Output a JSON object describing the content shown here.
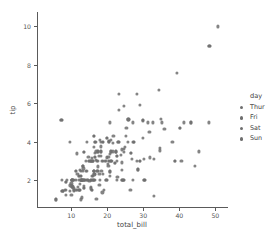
{
  "chart_data": {
    "type": "scatter",
    "title": "",
    "xlabel": "total_bill",
    "ylabel": "tip",
    "xlim": [
      0.5,
      53.5
    ],
    "ylim": [
      0.55,
      10.75
    ],
    "xticks": [
      10,
      20,
      30,
      40,
      50
    ],
    "yticks": [
      2,
      4,
      6,
      8,
      10
    ],
    "grid": false,
    "legend": {
      "title": "day",
      "position": "right",
      "entries": [
        {
          "label": "Thur",
          "color": "#6e6e6e"
        },
        {
          "label": "Fri",
          "color": "#6e6e6e"
        },
        {
          "label": "Sat",
          "color": "#6e6e6e"
        },
        {
          "label": "Sun",
          "color": "#6e6e6e"
        }
      ]
    },
    "marker": {
      "shape": "circle",
      "color": "#6e6e6e",
      "size": 3.2,
      "opacity": 0.85
    },
    "series": [
      {
        "name": "Sun",
        "color": "#6e6e6e",
        "x": [
          16.99,
          10.34,
          21.01,
          23.68,
          24.59,
          25.29,
          8.77,
          26.88,
          15.04,
          14.78,
          10.27,
          35.26,
          15.42,
          18.43,
          14.83,
          21.58,
          10.33,
          16.29,
          16.97,
          20.65,
          17.92,
          20.29,
          15.77,
          39.42,
          19.82,
          17.81,
          13.37,
          12.69,
          21.7,
          19.65,
          9.55,
          18.35,
          15.06,
          20.69,
          17.78,
          24.06,
          16.31,
          16.93,
          18.69,
          31.27,
          16.04,
          30.46,
          18.15,
          23.1,
          15.69,
          19.81,
          28.44,
          15.48,
          16.58,
          7.56,
          10.34,
          43.11,
          13.0,
          13.51,
          18.71,
          12.74,
          13.0,
          16.4,
          20.53,
          16.47,
          26.59,
          38.73,
          24.27,
          12.76,
          30.06,
          25.89,
          48.33,
          13.27,
          28.17,
          12.9,
          28.15,
          11.59,
          7.74,
          30.14,
          12.16,
          13.42,
          8.58,
          15.98,
          13.42,
          16.27,
          10.09,
          20.45,
          13.28,
          22.12,
          24.01,
          15.69,
          11.61,
          10.77,
          15.53,
          10.07,
          12.6,
          32.83,
          35.83,
          29.03,
          27.18,
          22.67,
          17.82,
          18.78
        ],
        "y": [
          1.01,
          1.66,
          3.5,
          3.31,
          3.61,
          4.71,
          2.0,
          3.12,
          1.96,
          3.23,
          1.71,
          5.0,
          1.57,
          3.0,
          3.02,
          3.92,
          1.67,
          3.71,
          3.5,
          3.35,
          4.08,
          2.75,
          2.23,
          7.58,
          3.18,
          2.34,
          2.0,
          2.0,
          4.3,
          3.0,
          1.45,
          2.5,
          3.0,
          2.45,
          3.27,
          3.6,
          2.0,
          3.07,
          2.31,
          5.0,
          2.24,
          2.0,
          3.5,
          4.0,
          1.5,
          4.19,
          2.56,
          2.02,
          4.0,
          1.44,
          2.0,
          5.0,
          2.0,
          2.0,
          4.0,
          2.01,
          2.0,
          2.5,
          4.0,
          3.23,
          3.41,
          3.0,
          2.03,
          2.23,
          2.0,
          5.16,
          9.0,
          2.5,
          6.5,
          1.1,
          3.0,
          1.5,
          1.44,
          3.09,
          2.2,
          3.48,
          1.92,
          3.0,
          1.58,
          2.5,
          2.0,
          3.0,
          2.72,
          2.88,
          2.0,
          3.0,
          3.39,
          1.47,
          3.0,
          1.25,
          1.0,
          1.17,
          4.67,
          5.92,
          2.0,
          2.0,
          1.75,
          3.0
        ]
      },
      {
        "name": "Sat",
        "color": "#6e6e6e",
        "x": [
          20.29,
          15.77,
          20.69,
          16.43,
          20.49,
          17.07,
          26.41,
          17.26,
          24.55,
          19.77,
          29.85,
          48.17,
          25.0,
          13.39,
          16.49,
          21.5,
          12.66,
          16.21,
          13.81,
          17.51,
          24.52,
          20.76,
          31.71,
          10.59,
          10.63,
          50.81,
          15.81,
          7.25,
          31.85,
          16.82,
          32.9,
          17.89,
          14.48,
          9.6,
          34.63,
          34.65,
          23.33,
          45.35,
          23.17,
          40.55,
          20.69,
          20.9,
          30.46,
          18.15,
          23.1,
          15.69,
          19.81,
          28.44,
          15.48,
          16.58,
          7.56,
          10.34,
          43.11,
          13.0,
          13.51,
          18.71,
          12.74,
          13.0,
          16.4,
          20.53,
          16.47,
          26.59,
          38.73,
          24.27,
          12.76,
          30.06,
          25.89,
          48.33
        ],
        "y": [
          3.21,
          2.0,
          5.0,
          2.31,
          4.06,
          3.0,
          1.5,
          2.5,
          2.0,
          2.0,
          5.14,
          5.0,
          3.75,
          2.61,
          2.0,
          3.5,
          2.5,
          2.0,
          2.0,
          3.0,
          3.48,
          2.24,
          4.5,
          1.61,
          2.0,
          10.0,
          3.16,
          5.15,
          3.18,
          4.0,
          3.11,
          2.0,
          2.0,
          4.0,
          3.55,
          3.68,
          5.65,
          3.5,
          6.5,
          3.0,
          2.45,
          3.5,
          2.0,
          3.5,
          4.0,
          1.5,
          4.19,
          2.56,
          2.02,
          4.0,
          1.44,
          2.0,
          5.0,
          2.0,
          2.0,
          4.0,
          2.01,
          2.0,
          2.5,
          4.0,
          3.23,
          3.41,
          3.0,
          2.03,
          2.23,
          2.0,
          5.16,
          9.0
        ]
      },
      {
        "name": "Thur",
        "color": "#6e6e6e",
        "x": [
          27.2,
          22.76,
          17.29,
          19.44,
          16.66,
          10.07,
          32.68,
          15.98,
          34.83,
          13.03,
          18.28,
          24.71,
          21.16,
          28.97,
          22.49,
          5.75,
          16.32,
          22.75,
          40.17,
          27.28,
          12.03,
          21.01,
          12.46,
          11.35,
          15.38,
          44.3,
          22.42,
          20.92,
          15.36,
          20.49,
          25.21,
          18.24,
          14.31,
          14.0,
          7.25,
          38.07,
          23.95,
          25.71,
          17.31,
          29.93,
          10.65,
          12.43,
          24.08,
          11.69,
          13.42,
          14.26,
          15.95,
          12.48,
          29.8,
          8.52,
          14.52,
          11.38,
          22.82,
          19.08,
          20.27,
          11.17,
          12.26,
          18.26,
          8.51,
          10.33,
          14.15,
          16.0,
          13.16,
          17.47,
          34.3,
          41.19,
          27.05,
          16.43,
          8.35,
          18.64,
          11.87,
          9.78,
          7.51,
          14.07,
          13.13,
          17.26,
          24.55,
          19.77,
          29.85
        ],
        "y": [
          4.0,
          3.0,
          2.71,
          3.0,
          3.4,
          1.83,
          5.0,
          3.0,
          5.17,
          2.0,
          4.0,
          5.85,
          3.0,
          3.0,
          3.5,
          1.0,
          4.3,
          3.25,
          4.73,
          4.0,
          1.5,
          3.0,
          1.5,
          2.5,
          3.0,
          2.75,
          3.48,
          4.08,
          1.64,
          4.06,
          4.29,
          3.76,
          4.0,
          3.0,
          5.15,
          4.0,
          2.55,
          4.0,
          3.5,
          5.07,
          1.5,
          1.8,
          2.92,
          2.31,
          1.68,
          2.5,
          2.0,
          2.52,
          4.2,
          1.48,
          2.0,
          2.0,
          2.18,
          1.5,
          2.83,
          1.5,
          2.0,
          3.25,
          1.25,
          2.0,
          2.0,
          2.0,
          2.75,
          3.5,
          6.7,
          5.0,
          5.0,
          2.3,
          1.5,
          1.36,
          1.63,
          1.73,
          2.0,
          2.5,
          2.0,
          2.5,
          2.0,
          2.0,
          5.14
        ]
      },
      {
        "name": "Fri",
        "color": "#6e6e6e",
        "x": [
          28.97,
          22.49,
          5.75,
          16.32,
          22.75,
          40.17,
          27.28,
          12.03,
          21.01,
          12.46,
          11.35,
          15.38,
          12.16,
          13.42,
          8.58,
          15.98,
          13.42,
          16.27,
          10.09,
          20.45,
          13.28,
          22.12,
          24.01
        ],
        "y": [
          3.0,
          3.5,
          1.0,
          4.3,
          3.25,
          4.73,
          4.0,
          1.5,
          3.0,
          1.5,
          2.5,
          3.0,
          2.2,
          3.48,
          1.92,
          3.0,
          1.58,
          2.5,
          2.0,
          3.0,
          2.72,
          2.88,
          2.0
        ]
      }
    ]
  }
}
